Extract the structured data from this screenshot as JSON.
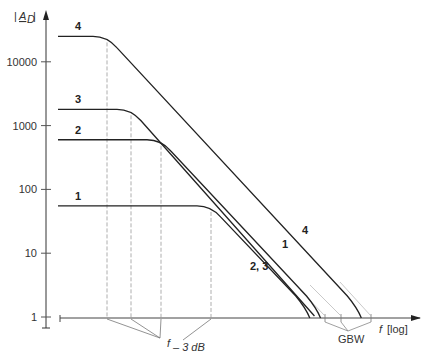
{
  "chart_data": {
    "type": "line",
    "title": "",
    "ylabel": "|A_D|",
    "xlabel": "f [log]",
    "yscale": "log",
    "ylim": [
      1,
      30000
    ],
    "yticks": [
      1,
      10,
      100,
      1000,
      10000
    ],
    "ytick_labels": [
      "1",
      "10",
      "100",
      "1000",
      "10000"
    ],
    "grid": false,
    "series": [
      {
        "name": "4",
        "plateau_gain": 25000,
        "label": "4"
      },
      {
        "name": "3",
        "plateau_gain": 1800,
        "label": "3"
      },
      {
        "name": "2",
        "plateau_gain": 600,
        "label": "2"
      },
      {
        "name": "1",
        "plateau_gain": 55,
        "label": "1"
      }
    ],
    "annotations": {
      "cutoff_label": "f",
      "cutoff_subscript": "– 3 dB",
      "gbw_label": "GBW",
      "rolloff_labels": [
        "4",
        "1",
        "2, 3"
      ]
    }
  }
}
